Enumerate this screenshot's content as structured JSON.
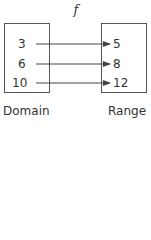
{
  "function_label": "f",
  "domain": {
    "label": "Domain",
    "values": [
      "3",
      "6",
      "10"
    ]
  },
  "range": {
    "label": "Range",
    "values": [
      "5",
      "8",
      "12"
    ]
  },
  "mappings": [
    {
      "from": "3",
      "to": "5"
    },
    {
      "from": "6",
      "to": "8"
    },
    {
      "from": "10",
      "to": "12"
    }
  ],
  "colors": {
    "stroke": "#555555",
    "text": "#333333"
  }
}
